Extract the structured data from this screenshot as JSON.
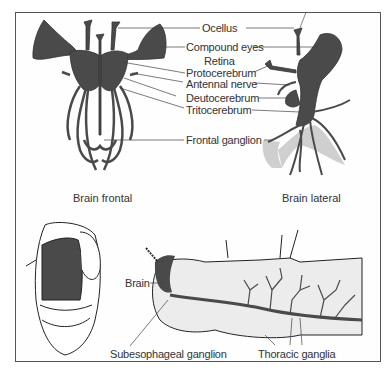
{
  "figure": {
    "top_left_caption": "Brain frontal",
    "top_right_caption": "Brain lateral",
    "brain_labels": [
      "Ocellus",
      "Compound eyes",
      "Retina",
      "Protocerebrum",
      "Antennal nerve",
      "Deutocerebrum",
      "Tritocerebrum",
      "Frontal ganglion"
    ],
    "bottom_labels": {
      "brain": "Brain",
      "subesophageal": "Subesophageal ganglion",
      "thoracic": "Thoracic ganglia"
    }
  },
  "colors": {
    "nerve_tissue": "#4a4a4a",
    "outline": "#222222",
    "shading": "#cfcfcf",
    "label_text": "#333333"
  }
}
